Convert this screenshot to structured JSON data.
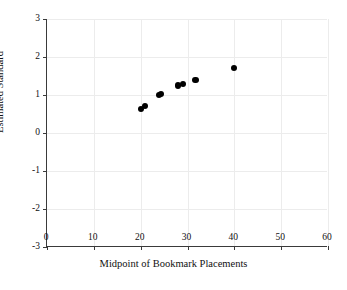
{
  "chart_data": {
    "type": "scatter",
    "title": "",
    "xlabel": "Midpoint of Bookmark Placements",
    "ylabel": "Estimated Standard",
    "xlim": [
      0,
      60
    ],
    "ylim": [
      -3,
      3
    ],
    "xticks": [
      0,
      10,
      20,
      30,
      40,
      50,
      60
    ],
    "yticks": [
      -3,
      -2,
      -1,
      0,
      1,
      2,
      3
    ],
    "xticklabels": [
      "0",
      "10",
      "20",
      "30",
      "40",
      "50",
      "60"
    ],
    "yticklabels": [
      "-3",
      "-2",
      "-1",
      "0",
      "1",
      "2",
      "3"
    ],
    "grid": true,
    "legend": null,
    "marker_color": "#000000",
    "series": [
      {
        "name": "Estimated Standard vs Midpoint",
        "points": [
          {
            "x": 20.0,
            "y": 0.63
          },
          {
            "x": 21.0,
            "y": 0.7
          },
          {
            "x": 24.0,
            "y": 1.0
          },
          {
            "x": 24.4,
            "y": 1.02
          },
          {
            "x": 28.0,
            "y": 1.25
          },
          {
            "x": 29.0,
            "y": 1.29
          },
          {
            "x": 31.7,
            "y": 1.39
          },
          {
            "x": 40.0,
            "y": 1.72
          }
        ]
      }
    ]
  },
  "axes": {
    "x_axis_label": "Midpoint of Bookmark Placements",
    "y_axis_label": "Estimated Standard"
  },
  "colors": {
    "marker": "#000000",
    "axis": "#3a3a3a",
    "grid": "#ececec",
    "background": "#ffffff"
  }
}
